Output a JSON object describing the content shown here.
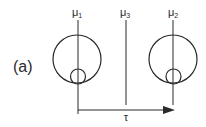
{
  "figure": {
    "panel_label": "(a)",
    "colors": {
      "line": "#2a2a2a",
      "background": "#ffffff"
    },
    "markers": [
      {
        "id": "mu1",
        "label_base": "μ",
        "label_sub": "1",
        "x": 78
      },
      {
        "id": "mu3",
        "label_base": "μ",
        "label_sub": "3",
        "x": 126
      },
      {
        "id": "mu2",
        "label_base": "μ",
        "label_sub": "2",
        "x": 173
      }
    ],
    "circle_pairs": [
      {
        "id": "left",
        "center_x": 77,
        "big_center_y": 59,
        "big_r": 24,
        "small_center_y": 76.5,
        "small_r": 7.5
      },
      {
        "id": "right",
        "center_x": 173,
        "big_center_y": 59,
        "big_r": 24,
        "small_center_y": 76.5,
        "small_r": 7.5
      }
    ],
    "arrow": {
      "label": "τ",
      "from_x": 78,
      "to_x": 175,
      "y": 110
    }
  }
}
